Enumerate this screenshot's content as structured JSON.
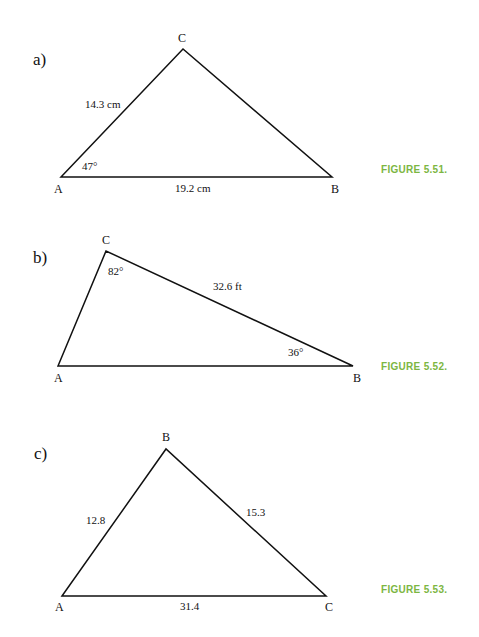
{
  "figures": [
    {
      "part": "a)",
      "caption": "FIGURE 5.51.",
      "vertices": {
        "top": "C",
        "left": "A",
        "right": "B"
      },
      "measurements": {
        "side_AC": "14.3 cm",
        "side_AB": "19.2 cm",
        "angle_A": "47°"
      }
    },
    {
      "part": "b)",
      "caption": "FIGURE 5.52.",
      "vertices": {
        "top": "C",
        "left": "A",
        "right": "B"
      },
      "measurements": {
        "side_CB": "32.6 ft",
        "angle_C": "82°",
        "angle_B": "36°"
      }
    },
    {
      "part": "c)",
      "caption": "FIGURE 5.53.",
      "vertices": {
        "top": "B",
        "left": "A",
        "right": "C"
      },
      "measurements": {
        "side_AB": "12.8",
        "side_BC": "15.3",
        "side_AC": "31.4"
      }
    }
  ],
  "colors": {
    "caption": "#7cb642",
    "lines": "#111111"
  }
}
